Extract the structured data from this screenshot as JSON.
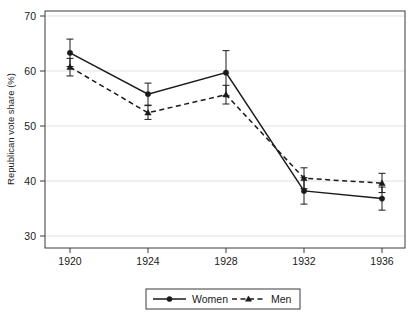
{
  "chart_data": {
    "type": "line",
    "title": "",
    "subtitle": "",
    "xlabel": "",
    "ylabel": "Republican vote share (%)",
    "categories": [
      "1920",
      "1924",
      "1928",
      "1932",
      "1936"
    ],
    "x": [
      1920,
      1924,
      1928,
      1932,
      1936
    ],
    "xlim": [
      1918,
      1938
    ],
    "ylim": [
      30,
      70
    ],
    "yticks": [
      30,
      40,
      50,
      60,
      70
    ],
    "ytick_labels": [
      "30",
      "40",
      "50",
      "60",
      "70"
    ],
    "xticks": [
      1920,
      1924,
      1928,
      1932,
      1936
    ],
    "xtick_labels": [
      "1920",
      "1924",
      "1928",
      "1932",
      "1936"
    ],
    "grid": "horizontal",
    "legend_position": "bottom-center",
    "error_bars": "vertical-capped",
    "series": [
      {
        "name": "Women",
        "linestyle": "solid",
        "marker": "circle",
        "color": "#1a1a1a",
        "values": [
          63.3,
          55.8,
          59.7,
          38.2,
          36.8
        ],
        "err_low": [
          60.8,
          53.8,
          55.5,
          35.8,
          34.7
        ],
        "err_high": [
          65.8,
          57.8,
          63.7,
          40.6,
          38.9
        ]
      },
      {
        "name": "Men",
        "linestyle": "dashed",
        "marker": "triangle",
        "color": "#1a1a1a",
        "values": [
          60.7,
          52.4,
          55.7,
          40.5,
          39.6
        ],
        "err_low": [
          59.1,
          51.2,
          54.0,
          38.6,
          37.9
        ],
        "err_high": [
          62.3,
          53.7,
          57.4,
          42.4,
          41.4
        ]
      }
    ]
  },
  "legend": {
    "items": [
      {
        "label": "Women",
        "style": "solid-circle"
      },
      {
        "label": "Men",
        "style": "dashed-triangle"
      }
    ]
  },
  "axes": {
    "y_title": "Republican vote share (%)",
    "x_title": ""
  }
}
